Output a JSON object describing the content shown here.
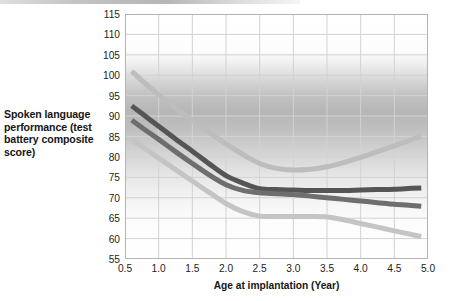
{
  "figure": {
    "background_color": "#ffffff",
    "plot_frame_color": "#b4b4b4",
    "grid_color": "#d2d2d2",
    "tick_text_color": "#1d1d1d",
    "label_text_color": "#161616"
  },
  "axis": {
    "y_label": "Spoken language performance (test battery composite score)",
    "x_label": "Age at implantation (Year)",
    "y_ticks": [
      "115",
      "110",
      "105",
      "100",
      "95",
      "90",
      "85",
      "80",
      "75",
      "70",
      "65",
      "60",
      "55"
    ],
    "x_ticks": [
      "0.5",
      "1.0",
      "1.5",
      "2.0",
      "2.5",
      "3.0",
      "3.5",
      "4.0",
      "4.5",
      "5.0"
    ]
  },
  "chart_data": {
    "type": "line",
    "title": "",
    "xlabel": "Age at implantation (Year)",
    "ylabel": "Spoken language performance (test battery composite score)",
    "xlim": [
      0.5,
      5.0
    ],
    "ylim": [
      55,
      115
    ],
    "xtick_step": 0.5,
    "ytick_step": 5,
    "grid": true,
    "legend": "none",
    "background": "vertical grayscale gradient band, white above 110, darkest near 103-96, fading to white below 80",
    "series": [
      {
        "name": "upper-confidence-band",
        "color": "#bdbdbd",
        "linewidth": 5,
        "x": [
          0.6,
          0.8,
          1.0,
          1.25,
          1.5,
          1.75,
          2.0,
          2.25,
          2.5,
          2.75,
          3.0,
          3.25,
          3.5,
          3.75,
          4.0,
          4.25,
          4.5,
          4.75,
          4.9
        ],
        "y": [
          101.0,
          98.0,
          95.2,
          92.0,
          89.0,
          86.0,
          83.2,
          80.6,
          78.4,
          77.2,
          76.8,
          77.0,
          77.6,
          78.6,
          79.9,
          81.3,
          82.7,
          84.2,
          85.0
        ]
      },
      {
        "name": "mean-estimate-upper",
        "color": "#555555",
        "linewidth": 5,
        "x": [
          0.6,
          0.8,
          1.0,
          1.25,
          1.5,
          1.75,
          2.0,
          2.25,
          2.5,
          2.75,
          3.0,
          3.25,
          3.5,
          3.75,
          4.0,
          4.25,
          4.5,
          4.75,
          4.9
        ],
        "y": [
          92.5,
          90.0,
          87.5,
          84.4,
          81.4,
          78.3,
          75.4,
          73.6,
          72.2,
          72.0,
          71.9,
          71.8,
          71.8,
          71.8,
          71.9,
          72.0,
          72.1,
          72.3,
          72.4
        ]
      },
      {
        "name": "mean-estimate-lower",
        "color": "#6e6e6e",
        "linewidth": 5,
        "x": [
          0.6,
          0.8,
          1.0,
          1.25,
          1.5,
          1.75,
          2.0,
          2.25,
          2.5,
          2.75,
          3.0,
          3.25,
          3.5,
          3.75,
          4.0,
          4.25,
          4.5,
          4.75,
          4.9
        ],
        "y": [
          89.0,
          86.6,
          84.3,
          81.3,
          78.4,
          75.6,
          73.2,
          71.8,
          71.2,
          71.0,
          70.8,
          70.4,
          70.0,
          69.6,
          69.2,
          68.8,
          68.4,
          68.1,
          67.9
        ]
      },
      {
        "name": "lower-confidence-band",
        "color": "#c4c4c4",
        "linewidth": 5,
        "x": [
          0.6,
          0.8,
          1.0,
          1.25,
          1.5,
          1.75,
          2.0,
          2.25,
          2.5,
          2.75,
          3.0,
          3.25,
          3.5,
          3.75,
          4.0,
          4.25,
          4.5,
          4.75,
          4.9
        ],
        "y": [
          84.2,
          82.0,
          79.7,
          76.9,
          74.1,
          71.3,
          68.6,
          66.6,
          65.5,
          65.4,
          65.4,
          65.4,
          65.3,
          64.6,
          63.7,
          62.8,
          61.9,
          61.0,
          60.5
        ]
      }
    ]
  }
}
